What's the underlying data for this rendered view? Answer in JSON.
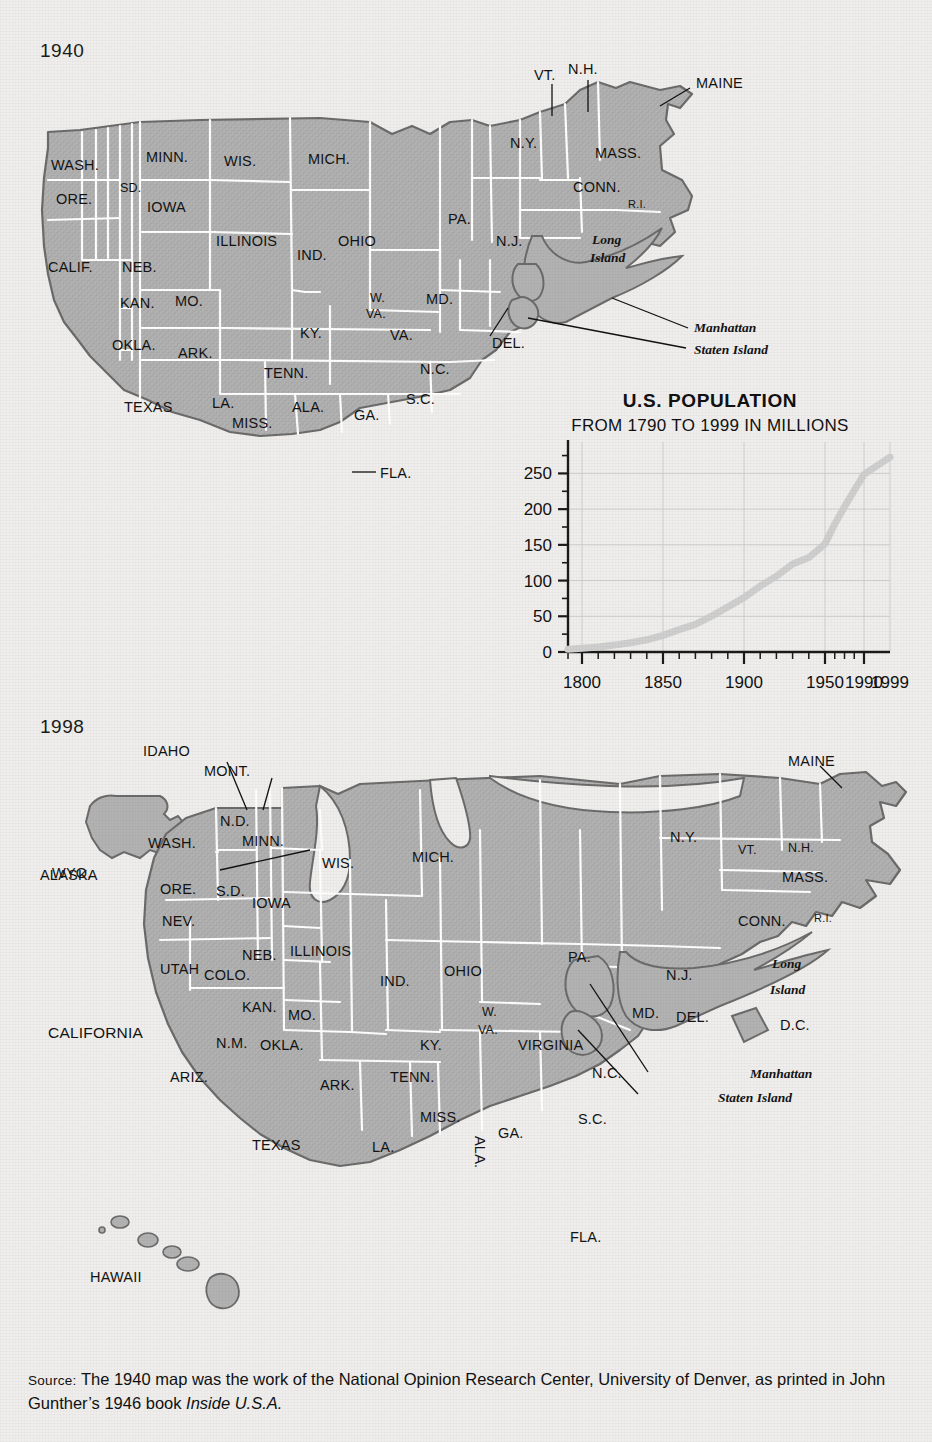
{
  "page": {
    "background_color": "#efeeec",
    "map_fill_color": "#b2b2b2",
    "map_border_color": "#6b6b6b",
    "inner_border_color": "#ffffff",
    "text_color": "#111111"
  },
  "map_1940": {
    "year": "1940",
    "state_labels": [
      "WASH.",
      "ORE.",
      "CALIF.",
      "SD.",
      "MINN.",
      "WIS.",
      "MICH.",
      "IOWA",
      "NEB.",
      "ILLINOIS",
      "IND.",
      "OHIO",
      "PA.",
      "KAN.",
      "MO.",
      "OKLA.",
      "ARK.",
      "TEXAS",
      "LA.",
      "MISS.",
      "ALA.",
      "TENN.",
      "KY.",
      "GA.",
      "S.C.",
      "N.C.",
      "VA.",
      "W. VA.",
      "MD.",
      "DEL.",
      "N.J.",
      "N.Y.",
      "CONN.",
      "R.I.",
      "MASS.",
      "VT.",
      "N.H.",
      "MAINE",
      "FLA."
    ],
    "callout_labels": [
      "VT.",
      "N.H.",
      "MAINE",
      "DEL.",
      "FLA."
    ],
    "island_labels": [
      "Long Island",
      "Manhattan",
      "Staten Island"
    ],
    "island_long": "Long",
    "island_island": "Island",
    "island_manhattan": "Manhattan",
    "island_staten": "Staten Island"
  },
  "map_1998": {
    "year": "1998",
    "state_labels": [
      "ALASKA",
      "HAWAII",
      "WASH.",
      "ORE.",
      "CALIFORNIA",
      "NEV.",
      "IDAHO",
      "MONT.",
      "WYO.",
      "UTAH",
      "COLO.",
      "ARIZ.",
      "N.M.",
      "N.D.",
      "S.D.",
      "NEB.",
      "KAN.",
      "OKLA.",
      "TEXAS",
      "MINN.",
      "IOWA",
      "MO.",
      "ARK.",
      "LA.",
      "WIS.",
      "ILLINOIS",
      "MICH.",
      "IND.",
      "OHIO",
      "KY.",
      "TENN.",
      "MISS.",
      "ALA.",
      "GA.",
      "FLA.",
      "S.C.",
      "N.C.",
      "VIRGINIA",
      "W. VA.",
      "MD.",
      "DEL.",
      "D.C.",
      "PA.",
      "N.J.",
      "N.Y.",
      "CONN.",
      "R.I.",
      "MASS.",
      "VT.",
      "N.H.",
      "MAINE"
    ],
    "callout_labels": [
      "IDAHO",
      "MONT.",
      "WYO.",
      "MAINE"
    ],
    "island_long": "Long",
    "island_island": "Island",
    "island_manhattan": "Manhattan",
    "island_staten": "Staten Island"
  },
  "chart_data": {
    "type": "line",
    "title": "U.S. POPULATION",
    "subtitle": "FROM 1790 TO 1999 IN MILLIONS",
    "xlabel": "",
    "ylabel": "",
    "ylim": [
      0,
      280
    ],
    "yticks": [
      0,
      50,
      100,
      150,
      200,
      250
    ],
    "ytick_labels": [
      "0",
      "50",
      "100",
      "150",
      "200",
      "250"
    ],
    "xtick_labels": [
      "1800",
      "1850",
      "1900",
      "1950",
      "1990",
      "1999"
    ],
    "xticks": [
      1800,
      1850,
      1900,
      1950,
      1990,
      1999
    ],
    "grid": true,
    "legend": "none",
    "line_color": "#cfcfcf",
    "x": [
      1790,
      1800,
      1810,
      1820,
      1830,
      1840,
      1850,
      1860,
      1870,
      1880,
      1890,
      1900,
      1910,
      1920,
      1930,
      1940,
      1950,
      1960,
      1970,
      1980,
      1990,
      1999
    ],
    "values": [
      3.9,
      5.3,
      7.2,
      9.6,
      12.9,
      17.1,
      23.2,
      31.4,
      38.6,
      50.2,
      63.0,
      76.2,
      92.2,
      106.0,
      123.2,
      132.2,
      151.3,
      179.3,
      203.3,
      226.5,
      248.7,
      272.7
    ]
  },
  "source": {
    "label": "Source:",
    "line1": "The 1940 map was the work of the National Opinion Research Center, University",
    "line2_a": "of Denver, as printed in John Gunther’s 1946 book ",
    "line2_italic": "Inside U.S.A."
  }
}
